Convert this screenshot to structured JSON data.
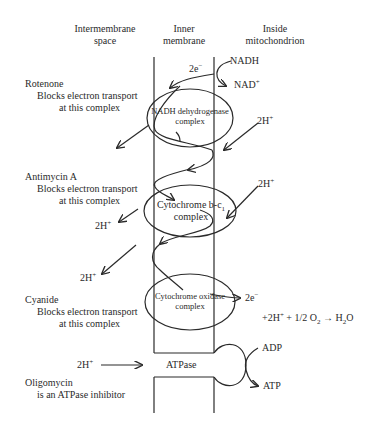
{
  "headers": {
    "intermembrane": [
      "Intermembrane",
      "space"
    ],
    "inner": [
      "Inner",
      "membrane"
    ],
    "inside": [
      "Inside",
      "mitochondrion"
    ]
  },
  "complexes": [
    {
      "name": "NADH dehydrogenase",
      "sub": "complex"
    },
    {
      "name": "Cytochrome b-c",
      "subscript": "1",
      "sub": "complex"
    },
    {
      "name": "Cytochrome oxidase",
      "sub": "complex"
    }
  ],
  "inhibitors": [
    {
      "name": "Rotenone",
      "line1": "Blocks electron transport",
      "line2": "at this complex"
    },
    {
      "name": "Antimycin A",
      "line1": "Blocks electron transport",
      "line2": "at this complex"
    },
    {
      "name": "Cyanide",
      "line1": "Blocks electron transport",
      "line2": "at this complex"
    },
    {
      "name": "Oligomycin",
      "line1": "is an ATPase inhibitor"
    }
  ],
  "species": {
    "nadh": "NADH",
    "nad": "NAD",
    "nad_sup": "+",
    "electrons_top": "2e",
    "electrons_bottom": "2e",
    "minus": "−",
    "proton": "2H",
    "plus": "+",
    "adp": "ADP",
    "atp": "ATP",
    "atpase": "ATPase"
  },
  "reaction": {
    "left": "+2H",
    "plus": "+",
    "mid": " + 1/2 O",
    "o_sub": "2",
    "arrow": "→",
    "product": "H",
    "h_sub": "2",
    "product_tail": "O"
  },
  "colors": {
    "line": "#2a2a2a",
    "text": "#2a2a2a",
    "background": "#ffffff"
  }
}
